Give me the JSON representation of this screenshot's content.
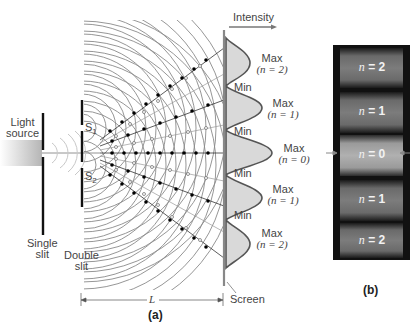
{
  "figure": {
    "part_a": {
      "caption": "(a)",
      "intensity_label": "Intensity",
      "light_source_label_line1": "Light",
      "light_source_label_line2": "source",
      "single_slit_label_line1": "Single",
      "single_slit_label_line2": "slit",
      "double_slit_label_line1": "Double",
      "double_slit_label_line2": "slit",
      "slit1_label": "S",
      "slit1_sub": "1",
      "slit2_label": "S",
      "slit2_sub": "2",
      "distance_label": "L",
      "screen_label": "Screen",
      "fringes": [
        {
          "type": "Max",
          "order": "(n = 2)"
        },
        {
          "type": "Min"
        },
        {
          "type": "Max",
          "order": "(n = 1)"
        },
        {
          "type": "Min"
        },
        {
          "type": "Max",
          "order": "(n = 0)"
        },
        {
          "type": "Min"
        },
        {
          "type": "Max",
          "order": "(n = 1)"
        },
        {
          "type": "Min"
        },
        {
          "type": "Max",
          "order": "(n = 2)"
        }
      ]
    },
    "part_b": {
      "caption": "(b)",
      "bands": [
        {
          "var": "n",
          "text": " = 2"
        },
        {
          "var": "n",
          "text": " = 1"
        },
        {
          "var": "n",
          "text": " = 0"
        },
        {
          "var": "n",
          "text": " = 1"
        },
        {
          "var": "n",
          "text": " = 2"
        }
      ]
    },
    "colors": {
      "wave": "#8a8a8a",
      "intensity_fill": "#d9d9d9",
      "intensity_line": "#555555",
      "screen": "#888888",
      "photo_bg": "#111111"
    }
  }
}
